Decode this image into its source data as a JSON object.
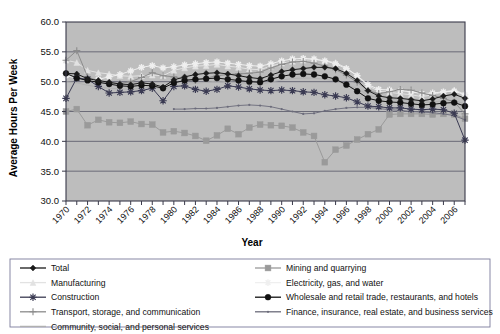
{
  "chart_data": {
    "type": "line",
    "title": "",
    "xlabel": "Year",
    "ylabel": "Average Hours Per Week",
    "xlim": [
      1970,
      2007
    ],
    "ylim": [
      30.0,
      60.0
    ],
    "yticks": [
      "30.0",
      "35.0",
      "40.0",
      "45.0",
      "50.0",
      "55.0",
      "60.0"
    ],
    "xticks": [
      "1970",
      "1972",
      "1974",
      "1976",
      "1978",
      "1980",
      "1982",
      "1984",
      "1986",
      "1988",
      "1990",
      "1992",
      "1994",
      "1996",
      "1998",
      "2000",
      "2002",
      "2004",
      "2006"
    ],
    "grid": true,
    "legend_position": "bottom",
    "x": [
      1970,
      1971,
      1972,
      1973,
      1974,
      1975,
      1976,
      1977,
      1978,
      1979,
      1980,
      1981,
      1982,
      1983,
      1984,
      1985,
      1986,
      1987,
      1988,
      1989,
      1990,
      1991,
      1992,
      1993,
      1994,
      1995,
      1996,
      1997,
      1998,
      1999,
      2000,
      2001,
      2002,
      2003,
      2004,
      2005,
      2006,
      2007
    ],
    "series": [
      {
        "name": "Total",
        "marker": "diamond",
        "color": "#1a1a1a",
        "values": [
          51.4,
          51.3,
          50.5,
          50.2,
          49.9,
          49.6,
          49.5,
          49.8,
          49.6,
          49.1,
          50.3,
          50.8,
          51.2,
          51.4,
          51.5,
          51.3,
          51.0,
          50.7,
          50.5,
          51.1,
          51.7,
          52.0,
          52.2,
          52.4,
          52.4,
          52.2,
          51.4,
          50.2,
          48.5,
          47.6,
          47.3,
          47.2,
          47.0,
          46.8,
          47.1,
          47.6,
          47.9,
          47.2
        ]
      },
      {
        "name": "Manufacturing",
        "marker": "triangle",
        "color": "#e2e2e2",
        "values": [
          53.6,
          53.2,
          51.9,
          51.5,
          51.3,
          51.0,
          50.9,
          51.0,
          51.1,
          51.0,
          51.9,
          52.3,
          52.6,
          52.7,
          52.9,
          52.6,
          52.4,
          52.1,
          52.0,
          52.6,
          53.1,
          53.4,
          53.6,
          53.7,
          53.5,
          53.2,
          52.3,
          51.0,
          49.3,
          48.4,
          48.2,
          48.0,
          47.8,
          47.5,
          47.8,
          48.3,
          48.6,
          47.9
        ]
      },
      {
        "name": "Construction",
        "marker": "asterisk",
        "color": "#3a3a52",
        "values": [
          47.2,
          50.6,
          50.4,
          49.2,
          48.1,
          48.2,
          48.3,
          48.5,
          48.9,
          46.8,
          49.2,
          49.3,
          48.7,
          48.4,
          48.7,
          49.3,
          49.1,
          48.8,
          48.6,
          48.5,
          48.6,
          48.5,
          48.3,
          48.2,
          47.8,
          47.6,
          47.3,
          46.6,
          45.9,
          45.8,
          45.6,
          45.6,
          45.4,
          45.3,
          45.4,
          45.3,
          44.7,
          40.2
        ]
      },
      {
        "name": "Transport, storage, and communication",
        "marker": "plus",
        "color": "#8c8c8c",
        "values": [
          53.6,
          55.2,
          50.8,
          50.1,
          49.8,
          49.7,
          50.0,
          50.7,
          51.5,
          51.0,
          50.8,
          50.4,
          50.2,
          50.6,
          51.0,
          51.2,
          51.3,
          51.4,
          51.6,
          52.3,
          52.9,
          53.3,
          53.4,
          53.1,
          52.6,
          52.0,
          51.1,
          49.9,
          48.5,
          48.0,
          48.3,
          48.7,
          48.6,
          48.1,
          47.7,
          47.2,
          46.6,
          44.6
        ]
      },
      {
        "name": "Community, social, and personal services",
        "marker": "none",
        "color": "#b0b0b0",
        "values": [
          50.0,
          49.8,
          49.4,
          49.1,
          48.9,
          48.8,
          48.7,
          48.9,
          49.0,
          48.8,
          49.2,
          49.5,
          49.7,
          49.9,
          50.1,
          50.0,
          49.8,
          49.6,
          49.5,
          49.9,
          50.3,
          50.5,
          50.6,
          50.6,
          50.4,
          50.1,
          49.6,
          48.8,
          47.8,
          47.2,
          47.0,
          46.9,
          46.7,
          46.5,
          46.6,
          46.8,
          46.9,
          46.2
        ]
      },
      {
        "name": "Mining and quarrying",
        "marker": "square",
        "color": "#9a9a9a",
        "values": [
          45.0,
          45.4,
          42.7,
          43.6,
          43.2,
          43.1,
          43.3,
          42.9,
          42.8,
          41.5,
          41.7,
          41.4,
          40.9,
          40.1,
          41.0,
          42.1,
          41.2,
          42.3,
          42.8,
          42.7,
          42.6,
          42.3,
          41.5,
          40.9,
          36.5,
          38.6,
          39.3,
          40.3,
          41.2,
          42.0,
          44.5,
          44.6,
          44.6,
          44.6,
          44.5,
          44.6,
          44.5,
          43.8
        ]
      },
      {
        "name": "Electricity, gas, and water",
        "marker": "star",
        "color": "#efefef",
        "values": [
          51.0,
          50.6,
          50.2,
          50.4,
          50.8,
          51.2,
          51.8,
          52.4,
          52.7,
          52.3,
          52.5,
          52.8,
          53.0,
          53.2,
          53.3,
          53.1,
          52.9,
          52.7,
          52.6,
          53.0,
          53.5,
          53.8,
          53.9,
          53.8,
          53.5,
          53.0,
          52.2,
          51.0,
          49.5,
          48.7,
          48.6,
          48.5,
          48.3,
          48.0,
          48.1,
          48.3,
          48.4,
          47.8
        ]
      },
      {
        "name": "Wholesale and retail trade, restaurants, and hotels",
        "marker": "circle",
        "color": "#111111",
        "values": [
          51.4,
          50.6,
          50.2,
          49.9,
          49.6,
          49.3,
          49.2,
          49.4,
          49.3,
          48.9,
          49.8,
          50.2,
          50.4,
          50.5,
          50.6,
          50.4,
          50.2,
          50.0,
          49.9,
          50.4,
          50.9,
          51.2,
          51.3,
          51.2,
          50.9,
          50.4,
          49.5,
          48.4,
          47.2,
          46.8,
          46.6,
          46.5,
          46.3,
          46.1,
          46.2,
          46.4,
          46.5,
          45.9
        ]
      },
      {
        "name": "Finance, insurance, real estate, and business services",
        "marker": "smalldot",
        "color": "#6b6b7a",
        "values": [
          null,
          null,
          null,
          null,
          null,
          null,
          null,
          null,
          null,
          null,
          45.4,
          45.4,
          45.5,
          45.5,
          45.6,
          45.8,
          46.0,
          46.1,
          46.0,
          45.8,
          45.4,
          45.0,
          44.6,
          44.7,
          45.1,
          45.4,
          45.6,
          45.7,
          45.7,
          45.5,
          45.3,
          45.2,
          45.0,
          44.9,
          44.8,
          44.6,
          44.3,
          43.6
        ]
      }
    ]
  },
  "legend": {
    "column1": [
      {
        "label": "Total",
        "marker": "diamond",
        "color": "#1a1a1a"
      },
      {
        "label": "Manufacturing",
        "marker": "triangle",
        "color": "#e2e2e2"
      },
      {
        "label": "Construction",
        "marker": "asterisk",
        "color": "#3a3a52"
      },
      {
        "label": "Transport, storage, and communication",
        "marker": "plus",
        "color": "#8c8c8c"
      },
      {
        "label": "Community, social, and personal services",
        "marker": "none",
        "color": "#b0b0b0"
      }
    ],
    "column2": [
      {
        "label": "Mining and quarrying",
        "marker": "square",
        "color": "#9a9a9a"
      },
      {
        "label": "Electricity, gas, and water",
        "marker": "star",
        "color": "#efefef"
      },
      {
        "label": "Wholesale and retail trade, restaurants, and hotels",
        "marker": "circle",
        "color": "#111111"
      },
      {
        "label": "Finance, insurance, real estate, and business services",
        "marker": "smalldot",
        "color": "#6b6b7a"
      }
    ]
  },
  "colors": {
    "plot_background": "#bdbdbd",
    "axis": "#3a3a4a",
    "gridline": "#555566",
    "legend_border": "#7b7b9b"
  }
}
